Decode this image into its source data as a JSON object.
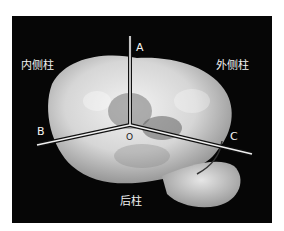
{
  "figure": {
    "labels": {
      "medial_column": "内侧柱",
      "lateral_column": "外侧柱",
      "posterior_column": "后柱"
    },
    "axis_points": {
      "a": "A",
      "b": "B",
      "c": "C",
      "origin": "O"
    },
    "colors": {
      "background": "#060606",
      "specimen": "#d8d8d8",
      "lines": "#f0f0f0"
    }
  }
}
